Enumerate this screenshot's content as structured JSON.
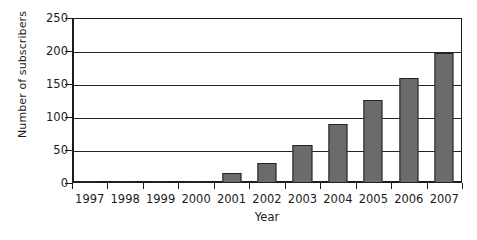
{
  "chart_data": {
    "type": "bar",
    "title": "",
    "xlabel": "Year",
    "ylabel": "Number of subscribers",
    "categories": [
      "1997",
      "1998",
      "1999",
      "2000",
      "2001",
      "2002",
      "2003",
      "2004",
      "2005",
      "2006",
      "2007"
    ],
    "values": [
      0,
      1,
      1,
      1,
      15,
      31,
      58,
      89,
      126,
      159,
      197
    ],
    "ylim": [
      0,
      250
    ],
    "yticks": [
      0,
      50,
      100,
      150,
      200,
      250
    ],
    "ytick_labels": [
      "0",
      "50",
      "100",
      "150",
      "200",
      "250"
    ],
    "grid": "horizontal",
    "legend": "none",
    "series": [
      {
        "name": "Number of subscribers",
        "values": [
          0,
          1,
          1,
          1,
          15,
          31,
          58,
          89,
          126,
          159,
          197
        ]
      }
    ],
    "colors": {
      "bar_fill": "#6b6b6b",
      "bar_stroke": "#232323",
      "axis": "#1c1c1c",
      "grid": "#242424",
      "background": "#ffffff",
      "text": "#1b1b1b"
    }
  }
}
